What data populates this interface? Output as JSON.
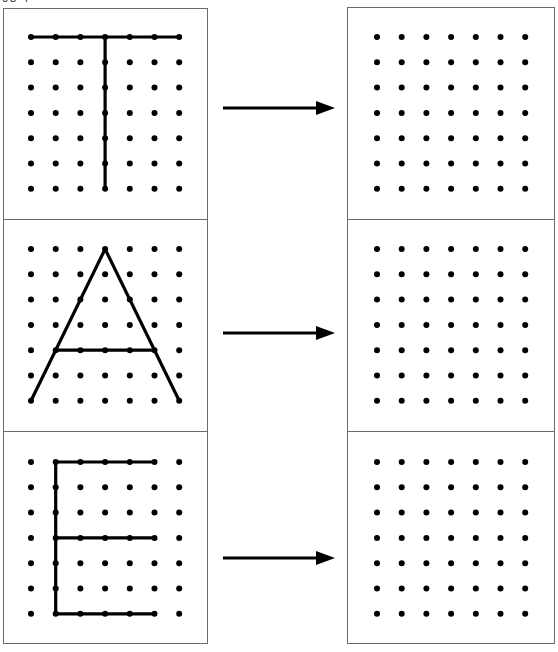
{
  "header": {
    "cut_off_text": "98 4"
  },
  "colors": {
    "ink": "#000000",
    "border": "#6b6b6b",
    "background": "#ffffff"
  },
  "grid": {
    "rows": 7,
    "cols": 7,
    "dot_radius": 3
  },
  "rows": [
    {
      "letter": "T",
      "source_grid": "7x7 dot grid with letter T drawn",
      "target_grid": "empty 7x7 dot grid",
      "arrow": "right-arrow",
      "segments": [
        [
          [
            0,
            0
          ],
          [
            6,
            0
          ]
        ],
        [
          [
            3,
            0
          ],
          [
            3,
            6
          ]
        ]
      ]
    },
    {
      "letter": "A",
      "source_grid": "7x7 dot grid with letter A drawn",
      "target_grid": "empty 7x7 dot grid",
      "arrow": "right-arrow",
      "segments": [
        [
          [
            0,
            6
          ],
          [
            3,
            0
          ]
        ],
        [
          [
            3,
            0
          ],
          [
            6,
            6
          ]
        ],
        [
          [
            1,
            4
          ],
          [
            5,
            4
          ]
        ]
      ]
    },
    {
      "letter": "E",
      "source_grid": "7x7 dot grid with letter E drawn",
      "target_grid": "empty 7x7 dot grid",
      "arrow": "right-arrow",
      "segments": [
        [
          [
            1,
            0
          ],
          [
            5,
            0
          ]
        ],
        [
          [
            1,
            0
          ],
          [
            1,
            6
          ]
        ],
        [
          [
            1,
            3
          ],
          [
            5,
            3
          ]
        ],
        [
          [
            1,
            6
          ],
          [
            5,
            6
          ]
        ]
      ]
    }
  ]
}
